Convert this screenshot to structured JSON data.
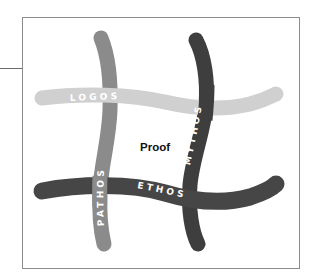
{
  "diagram": {
    "center_label": "Proof",
    "frame": {
      "stroke": "#8c8c8c"
    },
    "strands": {
      "logos": {
        "label": "LOGOS",
        "orientation": "horizontal",
        "position": "top",
        "color": "#d0d0d0"
      },
      "ethos": {
        "label": "ETHOS",
        "orientation": "horizontal",
        "position": "bottom",
        "color": "#464646"
      },
      "pathos": {
        "label": "PATHOS",
        "orientation": "vertical",
        "position": "left",
        "color": "#8b8b8b"
      },
      "mythos": {
        "label": "MYTHOS",
        "orientation": "vertical",
        "position": "right",
        "color": "#3e3e3e"
      }
    }
  }
}
